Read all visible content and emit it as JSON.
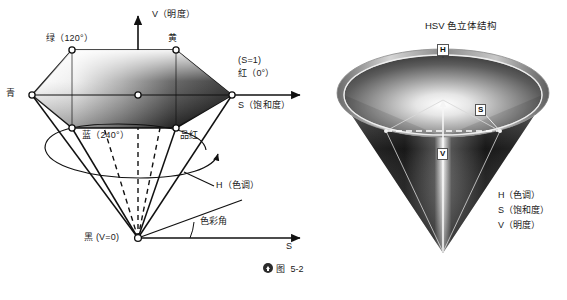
{
  "figure": {
    "caption_icon": "circled-up-arrow-icon",
    "caption_book": "图",
    "caption_number": "5-2"
  },
  "left_diagram": {
    "name": "HSV hexcone projection diagram",
    "axes": {
      "v_axis_label": "V（明度）",
      "s_axis_label": "S（饱和度）",
      "s_axis_short": "S"
    },
    "vertices": [
      {
        "key": "green",
        "label": "绿（120°）"
      },
      {
        "key": "yellow",
        "label": "黄"
      },
      {
        "key": "red",
        "label": "红（0°）"
      },
      {
        "key": "magenta",
        "label": "品红"
      },
      {
        "key": "blue",
        "label": "蓝（240°）"
      },
      {
        "key": "cyan",
        "label": "青"
      }
    ],
    "annotations": {
      "saturation_max": "(S=1)",
      "hue_label": "H（色调）",
      "hue_angle_label": "色彩角",
      "black_label": "黑 (V=0)"
    }
  },
  "right_diagram": {
    "title": "HSV 色立体结构",
    "markers": {
      "h": "H",
      "s": "S",
      "v": "V"
    },
    "legend": [
      "H（色调）",
      "S（饱和度）",
      "V（明度）"
    ]
  },
  "colors": {
    "ink": "#1a1a1a",
    "line": "#111111",
    "background": "#ffffff",
    "cone_light": "#f2f2f2",
    "cone_dark": "#0d0d0d"
  }
}
